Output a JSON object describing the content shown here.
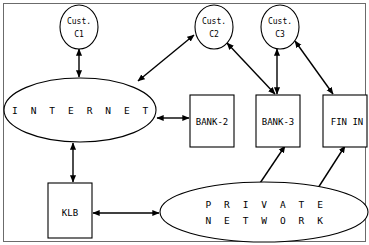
{
  "diagram": {
    "frame": {
      "name": "diagram-border"
    },
    "colors": {
      "background": "#ffffff",
      "stroke": "#000000",
      "frame": "#6b6b6b"
    },
    "nodes": [
      {
        "id": "cust-c1",
        "shape": "ellipse",
        "line1": "Cust.",
        "line2": "C1"
      },
      {
        "id": "cust-c2",
        "shape": "ellipse",
        "line1": "Cust.",
        "line2": "C2"
      },
      {
        "id": "cust-c3",
        "shape": "ellipse",
        "line1": "Cust.",
        "line2": "C3"
      },
      {
        "id": "internet",
        "shape": "ellipse",
        "line1": "I N T E R N E T",
        "line2": ""
      },
      {
        "id": "bank-2",
        "shape": "rect",
        "line1": "BANK-2",
        "line2": ""
      },
      {
        "id": "bank-3",
        "shape": "rect",
        "line1": "BANK-3",
        "line2": ""
      },
      {
        "id": "fin-in",
        "shape": "rect",
        "line1": "FIN IN",
        "line2": ""
      },
      {
        "id": "klb",
        "shape": "rect",
        "line1": "KLB",
        "line2": ""
      },
      {
        "id": "private-network",
        "shape": "ellipse",
        "line1": "P R I V A T E",
        "line2": "N E T W O R K"
      }
    ],
    "connections": [
      {
        "id": "conn-internet-cust-c1",
        "from": "internet",
        "to": "cust-c1",
        "arrows": "both"
      },
      {
        "id": "conn-internet-cust-c2",
        "from": "internet",
        "to": "cust-c2",
        "arrows": "both"
      },
      {
        "id": "conn-internet-bank-2",
        "from": "internet",
        "to": "bank-2",
        "arrows": "both"
      },
      {
        "id": "conn-internet-klb",
        "from": "internet",
        "to": "klb",
        "arrows": "both"
      },
      {
        "id": "conn-cust-c2-bank-3",
        "from": "cust-c2",
        "to": "bank-3",
        "arrows": "both"
      },
      {
        "id": "conn-cust-c3-bank-3",
        "from": "cust-c3",
        "to": "bank-3",
        "arrows": "both"
      },
      {
        "id": "conn-cust-c3-fin-in",
        "from": "cust-c3",
        "to": "fin-in",
        "arrows": "both"
      },
      {
        "id": "conn-bank-3-private-network",
        "from": "bank-3",
        "to": "private-network",
        "arrows": "both"
      },
      {
        "id": "conn-fin-in-private-network",
        "from": "fin-in",
        "to": "private-network",
        "arrows": "both"
      },
      {
        "id": "conn-klb-private-network",
        "from": "klb",
        "to": "private-network",
        "arrows": "both"
      }
    ]
  }
}
